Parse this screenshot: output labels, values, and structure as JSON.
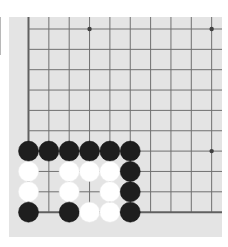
{
  "board": {
    "view": "bottom-left corner",
    "visible_columns": 10,
    "visible_rows": 10,
    "edges": [
      "left",
      "bottom"
    ],
    "colors": {
      "background": "#e4e4e4",
      "line": "#707070",
      "edge_line": "#606060",
      "black_stone": "#1e1e1e",
      "white_stone": "#ffffff",
      "star_point": "#404040"
    },
    "star_points": [
      {
        "col": 3,
        "row": 0
      },
      {
        "col": 9,
        "row": 0
      },
      {
        "col": 9,
        "row": 6
      },
      {
        "col": 3,
        "row": 6
      }
    ],
    "stones": [
      {
        "col": 0,
        "row": 6,
        "color": "black"
      },
      {
        "col": 1,
        "row": 6,
        "color": "black"
      },
      {
        "col": 2,
        "row": 6,
        "color": "black"
      },
      {
        "col": 3,
        "row": 6,
        "color": "black"
      },
      {
        "col": 4,
        "row": 6,
        "color": "black"
      },
      {
        "col": 5,
        "row": 6,
        "color": "black"
      },
      {
        "col": 0,
        "row": 7,
        "color": "white"
      },
      {
        "col": 2,
        "row": 7,
        "color": "white"
      },
      {
        "col": 3,
        "row": 7,
        "color": "white"
      },
      {
        "col": 4,
        "row": 7,
        "color": "white"
      },
      {
        "col": 5,
        "row": 7,
        "color": "black"
      },
      {
        "col": 0,
        "row": 8,
        "color": "white"
      },
      {
        "col": 2,
        "row": 8,
        "color": "white"
      },
      {
        "col": 4,
        "row": 8,
        "color": "white"
      },
      {
        "col": 5,
        "row": 8,
        "color": "black"
      },
      {
        "col": 0,
        "row": 9,
        "color": "black"
      },
      {
        "col": 2,
        "row": 9,
        "color": "black"
      },
      {
        "col": 3,
        "row": 9,
        "color": "white"
      },
      {
        "col": 4,
        "row": 9,
        "color": "white"
      },
      {
        "col": 5,
        "row": 9,
        "color": "black"
      }
    ]
  }
}
